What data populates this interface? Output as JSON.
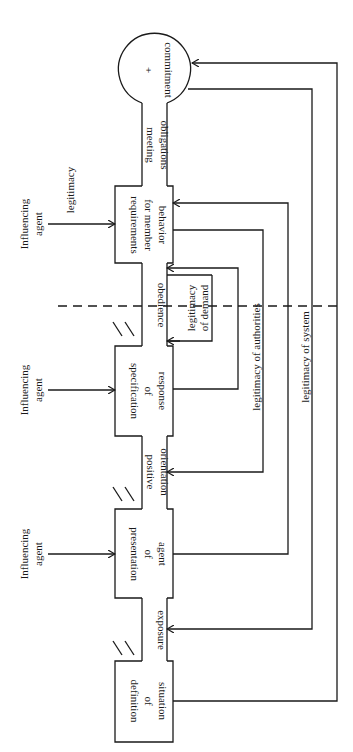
{
  "diagram": {
    "stages": [
      {
        "id": "definition",
        "lines": [
          "definition",
          "of",
          "situation"
        ]
      },
      {
        "id": "presentation",
        "lines": [
          "presentation",
          "of",
          "agent"
        ]
      },
      {
        "id": "specification",
        "lines": [
          "specification",
          "of",
          "response"
        ]
      },
      {
        "id": "requirements",
        "lines": [
          "requirements",
          "for member",
          "behavior"
        ]
      }
    ],
    "commitment": {
      "sign": "+",
      "label": "commitment"
    },
    "transitions": {
      "exposure": [
        "exposure"
      ],
      "positive_orientation": [
        "positive",
        "orientation"
      ],
      "obedience": [
        "obedience"
      ],
      "meeting_obligations": [
        "meeting",
        "obligations"
      ]
    },
    "influencing_agents": [
      {
        "lines": [
          "Influencing",
          "agent"
        ]
      },
      {
        "lines": [
          "Influencing",
          "agent"
        ]
      },
      {
        "lines": [
          "Influencing",
          "agent"
        ],
        "extra_label": "legitimacy"
      }
    ],
    "feedback": {
      "demand": [
        "legitimacy",
        "of demand"
      ],
      "authorities": "legitimacy of authorities",
      "system": "legitimacy of system"
    }
  }
}
